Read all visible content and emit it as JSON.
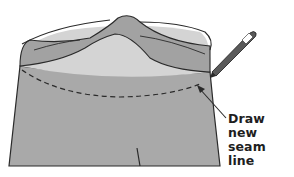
{
  "figure": {
    "annotation": {
      "line1": "Draw new",
      "line2": "seam line"
    },
    "colors": {
      "background": "#ffffff",
      "fabric_body": "#a9a9a9",
      "waistband_outer": "#a2a2a2",
      "waistband_inner": "#d4d4d4",
      "outline": "#2a2a2a",
      "pencil_body": "#5a5a5a",
      "pencil_tip": "#ffffff"
    },
    "icons": [
      "pencil-icon",
      "leader-arrow-icon"
    ]
  }
}
